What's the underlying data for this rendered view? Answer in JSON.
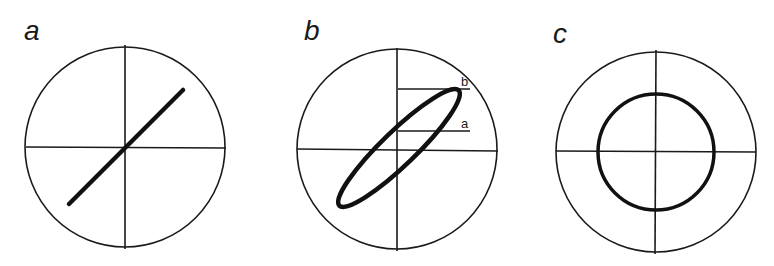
{
  "figure": {
    "panels": [
      {
        "label": "a",
        "description": "Circle with crosshair axes and a diagonal straight line through the center (in-phase / linear relationship)"
      },
      {
        "label": "b",
        "description": "Circle with crosshair axes and a narrow tilted ellipse; two horizontal reference lines marked a and b",
        "markers": {
          "upper": "b",
          "lower": "a"
        }
      },
      {
        "label": "c",
        "description": "Circle with crosshair axes and a concentric inner circle (90-degree phase shift)"
      }
    ],
    "colors": {
      "stroke": "#1a1a1a",
      "background": "#ffffff"
    }
  }
}
